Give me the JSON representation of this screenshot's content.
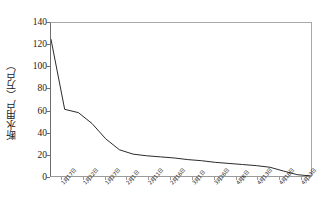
{
  "chart_data": {
    "type": "line",
    "title": "",
    "xlabel": "",
    "ylabel": "断水用户（万户）",
    "ylim": [
      0,
      140
    ],
    "yticks": [
      0,
      20,
      40,
      60,
      80,
      100,
      120,
      140
    ],
    "ytick_labels": [
      "0",
      "20",
      "40",
      "60",
      "80",
      "100",
      "120",
      "140"
    ],
    "grid": false,
    "legend": "none",
    "line_color": "#2b2b2b",
    "background_color": "#ffffff",
    "axis_color": "#6e6e6e",
    "categories": [
      "1月17日",
      "1月22日",
      "1月27日",
      "2月1日",
      "2月6日",
      "2月11日",
      "2月16日",
      "2月21日",
      "2月26日",
      "3月3日",
      "3月8日",
      "3月13日",
      "3月18日",
      "3月23日",
      "3月28日",
      "4月3日",
      "4月8日",
      "4月13日",
      "4月18日",
      "4月23日"
    ],
    "tick_labels": [
      "1月17日",
      "1月22日",
      "1月27日",
      "2月1日",
      "2月11日",
      "2月16日",
      "3月1日",
      "3月26日",
      "4月8日",
      "4月13日",
      "4月18日",
      "4月23日"
    ],
    "values": [
      125,
      61,
      58,
      48,
      34,
      24,
      20,
      18.5,
      17.5,
      16.5,
      15,
      14,
      12.5,
      11.5,
      10.5,
      9.5,
      8,
      4.5,
      1.2,
      0
    ],
    "series": [
      {
        "name": "断水用户",
        "values": [
          125,
          61,
          58,
          48,
          34,
          24,
          20,
          18.5,
          17.5,
          16.5,
          15,
          14,
          12.5,
          11.5,
          10.5,
          9.5,
          8,
          4.5,
          1.2,
          0
        ]
      }
    ]
  }
}
